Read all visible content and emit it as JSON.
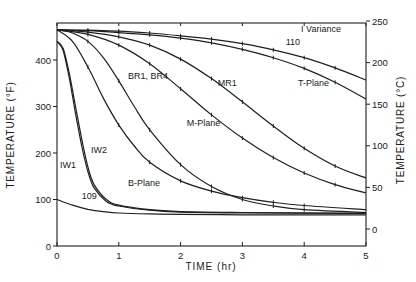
{
  "chart_data": {
    "type": "line",
    "title": "",
    "xlabel": "TIME (hr)",
    "ylabel": "TEMPERATURE (°F)",
    "ylabel_right": "TEMPERATURE (°C)",
    "xlim": [
      0,
      5
    ],
    "ylim": [
      0,
      470
    ],
    "ylim_right": [
      -18,
      250
    ],
    "x_ticks": [
      0,
      1,
      2,
      3,
      4,
      5
    ],
    "y_ticks": [
      0,
      100,
      200,
      300,
      400
    ],
    "y_ticks_right": [
      0,
      50,
      100,
      150,
      200,
      250
    ],
    "grid": false,
    "legend": {
      "position": "top-right",
      "entries": [
        "I Variance"
      ]
    },
    "series": [
      {
        "name": "110",
        "x": [
          0,
          0.5,
          1,
          1.5,
          2,
          2.5,
          3,
          3.5,
          4,
          4.5,
          5
        ],
        "values": [
          465,
          464,
          462,
          458,
          452,
          445,
          435,
          422,
          405,
          383,
          357
        ]
      },
      {
        "name": "T-Plane",
        "x": [
          0,
          0.5,
          1,
          1.5,
          2,
          2.5,
          3,
          3.5,
          4,
          4.5,
          5
        ],
        "values": [
          465,
          463,
          459,
          454,
          447,
          437,
          423,
          405,
          382,
          352,
          316
        ]
      },
      {
        "name": "MR1",
        "x": [
          0,
          0.5,
          1,
          1.5,
          2,
          2.5,
          3,
          3.5,
          4,
          4.5,
          5
        ],
        "values": [
          465,
          460,
          450,
          432,
          402,
          360,
          310,
          258,
          210,
          172,
          146
        ]
      },
      {
        "name": "M-Plane",
        "x": [
          0,
          0.5,
          1,
          1.5,
          2,
          2.5,
          3,
          3.5,
          4,
          4.5,
          5
        ],
        "values": [
          465,
          455,
          432,
          392,
          338,
          282,
          232,
          190,
          157,
          132,
          114
        ]
      },
      {
        "name": "BR1, BR4",
        "x": [
          0,
          0.25,
          0.5,
          0.75,
          1,
          1.25,
          1.5,
          2,
          2.5,
          3,
          3.5,
          4,
          5
        ],
        "values": [
          465,
          458,
          440,
          405,
          355,
          300,
          250,
          175,
          128,
          100,
          86,
          78,
          72
        ]
      },
      {
        "name": "B-Plane",
        "x": [
          0,
          0.25,
          0.5,
          0.75,
          1,
          1.25,
          1.5,
          2,
          2.5,
          3,
          3.5,
          4,
          5
        ],
        "values": [
          465,
          440,
          385,
          318,
          260,
          215,
          180,
          140,
          118,
          104,
          94,
          87,
          78
        ]
      },
      {
        "name": "IW2",
        "x": [
          0,
          0.1,
          0.2,
          0.3,
          0.4,
          0.5,
          0.6,
          0.8,
          1,
          1.5,
          2,
          3,
          5
        ],
        "values": [
          440,
          425,
          370,
          300,
          230,
          170,
          132,
          100,
          88,
          78,
          74,
          72,
          70
        ]
      },
      {
        "name": "IW1",
        "x": [
          0,
          0.1,
          0.2,
          0.3,
          0.4,
          0.5,
          0.6,
          0.8,
          1,
          1.5,
          2,
          3,
          5
        ],
        "values": [
          440,
          420,
          360,
          285,
          215,
          160,
          125,
          96,
          86,
          77,
          73,
          71,
          70
        ]
      },
      {
        "name": "109",
        "x": [
          0,
          0.25,
          0.5,
          0.75,
          1,
          1.5,
          2,
          3,
          4,
          5
        ],
        "values": [
          100,
          88,
          79,
          74,
          71,
          69,
          68,
          67,
          67,
          67
        ]
      }
    ],
    "annotations": [
      {
        "text": "110",
        "at": [
          3.7,
          432
        ]
      },
      {
        "text": "T-Plane",
        "at": [
          3.9,
          345
        ]
      },
      {
        "text": "MR1",
        "at": [
          2.6,
          345
        ]
      },
      {
        "text": "M-Plane",
        "at": [
          2.1,
          258
        ]
      },
      {
        "text": "BR1, BR4",
        "at": [
          1.15,
          360
        ]
      },
      {
        "text": "B-Plane",
        "at": [
          1.15,
          130
        ]
      },
      {
        "text": "IW2",
        "at": [
          0.55,
          200
        ]
      },
      {
        "text": "IW1",
        "at": [
          0.05,
          167
        ]
      },
      {
        "text": "109",
        "at": [
          0.4,
          102
        ]
      },
      {
        "text": "I Variance",
        "at": [
          3.95,
          460
        ]
      }
    ]
  },
  "labels": {
    "x_axis_title": "TIME (hr)",
    "y_axis_title_left": "TEMPERATURE (°F)",
    "y_axis_title_right": "TEMPERATURE (°C)",
    "legend_text": "I Variance"
  }
}
